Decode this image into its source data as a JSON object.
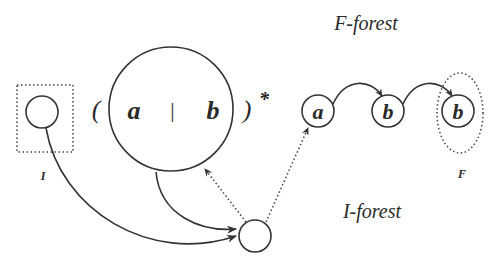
{
  "labels": {
    "f_forest": "F-forest",
    "i_forest": "I-forest",
    "initial": "I",
    "final": "F",
    "open_paren": "(",
    "close_paren": ")",
    "star": "*",
    "alt_bar": "|",
    "regex_a": "a",
    "regex_b": "b"
  },
  "forest_nodes": [
    {
      "id": "node-a",
      "label": "a"
    },
    {
      "id": "node-b1",
      "label": "b"
    },
    {
      "id": "node-b2",
      "label": "b"
    }
  ],
  "colors": {
    "stroke": "#333333",
    "text": "#2a2a2a",
    "background": "#ffffff"
  }
}
